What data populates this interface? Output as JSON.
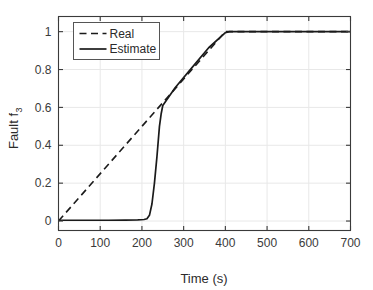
{
  "chart_data": {
    "type": "line",
    "title": "",
    "xlabel": "Time (s)",
    "ylabel_main": "Fault f",
    "ylabel_sub": "3",
    "ylabel": "Fault f_3",
    "xlim": [
      0,
      700
    ],
    "ylim": [
      -0.05,
      1.08
    ],
    "xticks": [
      0,
      100,
      200,
      300,
      400,
      500,
      600,
      700
    ],
    "xticklabels": [
      "0",
      "100",
      "200",
      "300",
      "400",
      "500",
      "600",
      "700"
    ],
    "yticks": [
      0,
      0.2,
      0.4,
      0.6,
      0.8,
      1
    ],
    "yticklabels": [
      "0",
      "0.2",
      "0.4",
      "0.6",
      "0.8",
      "1"
    ],
    "grid": true,
    "legend_position": "upper left",
    "series": [
      {
        "name": "Real",
        "style": "dashed",
        "color": "#1a1a1a",
        "x": [
          0,
          400,
          450,
          500,
          550,
          600,
          650,
          700
        ],
        "values": [
          0,
          1.0,
          1.0,
          1.0,
          1.0,
          1.0,
          1.0,
          1.0
        ]
      },
      {
        "name": "Estimate",
        "style": "solid",
        "color": "#1a1a1a",
        "x": [
          0,
          40,
          80,
          120,
          160,
          190,
          205,
          212,
          218,
          224,
          230,
          236,
          242,
          246,
          250,
          280,
          320,
          360,
          400,
          410,
          450,
          500,
          550,
          600,
          650,
          700
        ],
        "values": [
          0.004,
          0.004,
          0.004,
          0.004,
          0.005,
          0.006,
          0.008,
          0.012,
          0.03,
          0.09,
          0.2,
          0.34,
          0.5,
          0.565,
          0.61,
          0.705,
          0.81,
          0.915,
          0.995,
          1.0,
          1.0,
          1.0,
          1.0,
          1.0,
          1.0,
          1.0
        ]
      }
    ],
    "legend": [
      {
        "label": "Real",
        "style": "dashed"
      },
      {
        "label": "Estimate",
        "style": "solid"
      }
    ],
    "axis_color": "#3a3a3a",
    "grid_color": "#e8e8e8"
  }
}
